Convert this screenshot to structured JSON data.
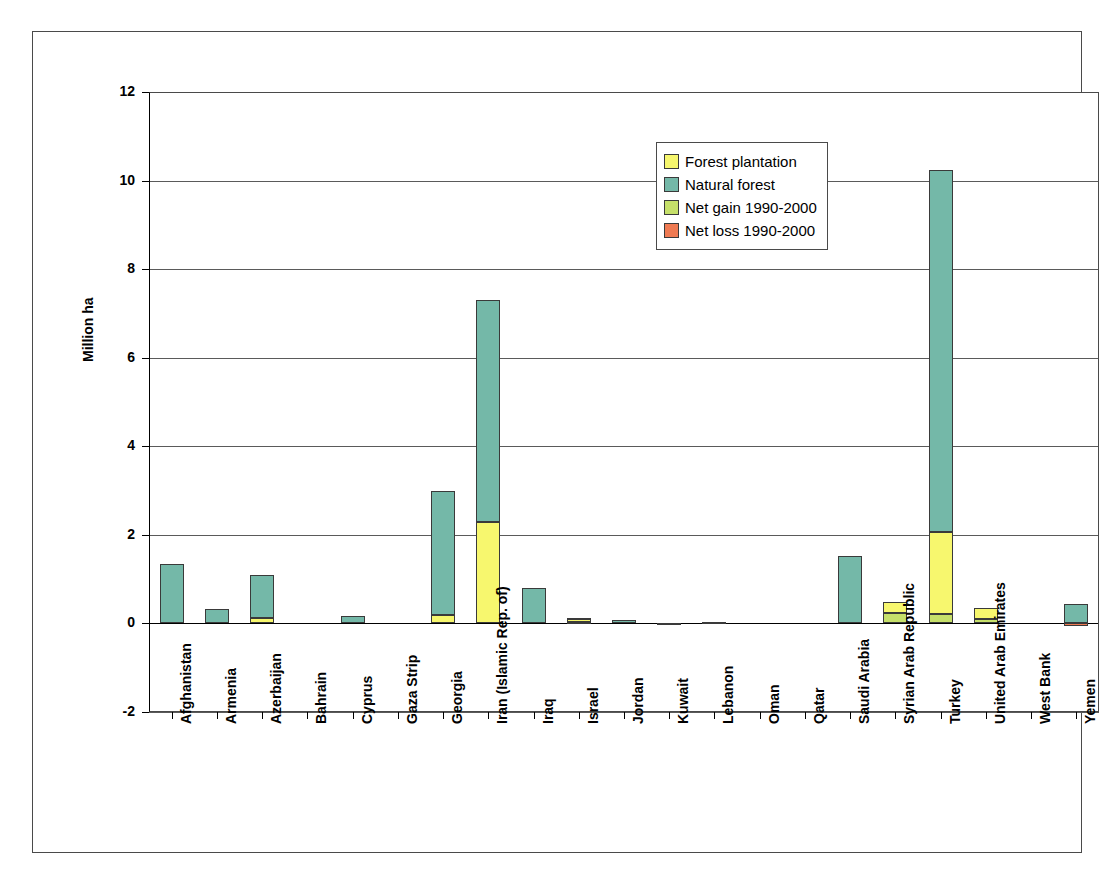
{
  "chart_data": {
    "type": "bar",
    "subtype": "stacked",
    "title": "",
    "xlabel": "",
    "ylabel": "Million ha",
    "ylim": [
      -2,
      12
    ],
    "yticks": [
      -2,
      0,
      2,
      4,
      6,
      8,
      10,
      12
    ],
    "ytick_labels": [
      "-2",
      "0",
      "2",
      "4",
      "6",
      "8",
      "10",
      "12"
    ],
    "grid": true,
    "legend_position": "upper center",
    "legend": [
      {
        "name": "Forest plantation",
        "color": "#f7f76e"
      },
      {
        "name": "Natural forest",
        "color": "#74b8a8"
      },
      {
        "name": "Net gain 1990-2000",
        "color": "#c6e06a"
      },
      {
        "name": "Net loss 1990-2000",
        "color": "#ef7a52"
      }
    ],
    "categories": [
      "Afghanistan",
      "Armenia",
      "Azerbaijan",
      "Bahrain",
      "Cyprus",
      "Gaza Strip",
      "Georgia",
      "Iran (Islamic Rep. of)",
      "Iraq",
      "Israel",
      "Jordan",
      "Kuwait",
      "Lebanon",
      "Oman",
      "Qatar",
      "Saudi Arabia",
      "Syrian Arab Republic",
      "Turkey",
      "United Arab Emirates",
      "West Bank",
      "Yemen"
    ],
    "series": [
      {
        "name": "Net gain 1990-2000",
        "color": "#c6e06a",
        "values": [
          0,
          0,
          0,
          0,
          0,
          0,
          0,
          0,
          0,
          0.04,
          0,
          0,
          0,
          0,
          0,
          0,
          0.24,
          0.22,
          0.09,
          0,
          0
        ]
      },
      {
        "name": "Forest plantation",
        "color": "#f7f76e",
        "values": [
          0,
          0,
          0.13,
          0,
          0,
          0,
          0.2,
          2.3,
          0,
          0.05,
          0,
          0,
          0,
          0,
          0,
          0,
          0.24,
          1.85,
          0.25,
          0,
          0
        ]
      },
      {
        "name": "Natural forest",
        "color": "#74b8a8",
        "values": [
          1.35,
          0.33,
          0.97,
          0,
          0.17,
          0,
          2.8,
          5.0,
          0.8,
          0.04,
          0.08,
          0.005,
          0.04,
          0,
          0,
          1.52,
          0,
          8.18,
          0,
          0,
          0.45
        ]
      },
      {
        "name": "Net loss 1990-2000",
        "color": "#ef7a52",
        "values": [
          0,
          0,
          0,
          0,
          0,
          0,
          0,
          0,
          0,
          0,
          0,
          0,
          0,
          0,
          0,
          0,
          0,
          0,
          0,
          0,
          -0.06
        ]
      }
    ],
    "totals_above_zero": [
      1.35,
      0.33,
      1.1,
      0,
      0.17,
      0,
      3.0,
      7.3,
      0.8,
      0.13,
      0.08,
      0.005,
      0.04,
      0,
      0,
      1.52,
      0.48,
      10.25,
      0.34,
      0,
      0.45
    ]
  }
}
